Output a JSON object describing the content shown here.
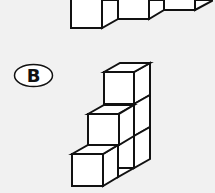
{
  "figure": {
    "option_label": "B",
    "background": "#f1f1f1",
    "stroke_color": "#111111",
    "face_color": "#ffffff"
  }
}
